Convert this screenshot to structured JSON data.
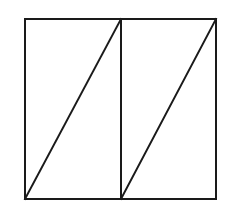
{
  "figure": {
    "name": "two-rectangles-with-diagonals",
    "background_color": "#ffffff",
    "stroke_color": "#1a1a1a",
    "stroke_width": 2,
    "canvas": {
      "width": 231,
      "height": 214
    }
  },
  "chart_data": {
    "type": "diagram",
    "title": "",
    "shapes": [
      {
        "id": "outer-square",
        "kind": "rectangle",
        "label": "outer square outline",
        "x": 25,
        "y": 19,
        "width": 191,
        "height": 180,
        "fill": "none",
        "stroke": "#1a1a1a",
        "stroke_width": 2
      },
      {
        "id": "vertical-divider",
        "kind": "line",
        "label": "vertical divider line",
        "x1": 121,
        "y1": 19,
        "x2": 121,
        "y2": 199,
        "stroke": "#1a1a1a",
        "stroke_width": 2
      },
      {
        "id": "diagonal-left",
        "kind": "line",
        "label": "left rectangle diagonal",
        "x1": 25,
        "y1": 199,
        "x2": 121,
        "y2": 19,
        "stroke": "#1a1a1a",
        "stroke_width": 2
      },
      {
        "id": "diagonal-right",
        "kind": "line",
        "label": "right rectangle diagonal",
        "x1": 121,
        "y1": 199,
        "x2": 216,
        "y2": 19,
        "stroke": "#1a1a1a",
        "stroke_width": 2
      }
    ],
    "regions": [
      {
        "id": "left-upper-triangle",
        "label": "upper-left triangle"
      },
      {
        "id": "left-lower-triangle",
        "label": "lower-left triangle"
      },
      {
        "id": "right-upper-triangle",
        "label": "upper-right triangle"
      },
      {
        "id": "right-lower-triangle",
        "label": "lower-right triangle"
      }
    ],
    "annotations": [],
    "labels": []
  }
}
